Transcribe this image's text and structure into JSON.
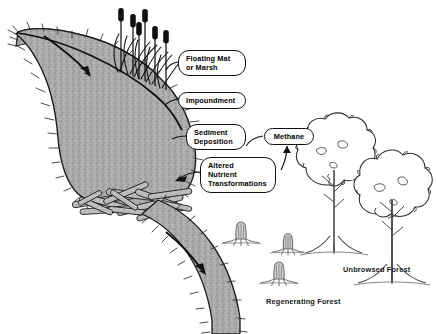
{
  "diagram": {
    "callouts": [
      {
        "id": "floating-mat",
        "text": "Floating Mat\nor Marsh",
        "x": 178,
        "y": 50,
        "w": 68,
        "h": 24
      },
      {
        "id": "impoundment",
        "text": "Impoundment",
        "x": 178,
        "y": 92,
        "w": 68,
        "h": 15
      },
      {
        "id": "sediment-deposition",
        "text": "Sediment\nDeposition",
        "x": 186,
        "y": 124,
        "w": 60,
        "h": 24
      },
      {
        "id": "altered-nutrient-transformations",
        "text": "Altered\nNutrient\nTransformations",
        "x": 200,
        "y": 157,
        "w": 74,
        "h": 35
      },
      {
        "id": "methane",
        "text": "Methane",
        "x": 264,
        "y": 128,
        "w": 50,
        "h": 15
      }
    ],
    "plain_labels": [
      {
        "id": "regenerating-forest",
        "text": "Regenerating Forest",
        "x": 266,
        "y": 297
      },
      {
        "id": "unbrowsed-forest",
        "text": "Unbrowsed Forest",
        "x": 343,
        "y": 265
      }
    ],
    "colors": {
      "water_fill": "#a9a9a9",
      "water_stroke": "#1a1a1a",
      "log_fill": "#b5b5b5",
      "ink": "#111111",
      "paper": "#ffffff"
    },
    "features": {
      "inlet_stream": "inlet stream flowing in from upper left with flow arrow",
      "pond": "large grey stippled beaver impoundment pond with hatched shoreline",
      "waterline": "dark line separating inlet channel from pond body",
      "cattails": 6,
      "dam": "beaver dam of interlocking logs across pond outlet",
      "outlet_stream": "outlet stream flowing down-right with flow arrow",
      "stumps": 3,
      "mature_trees": 2
    }
  }
}
